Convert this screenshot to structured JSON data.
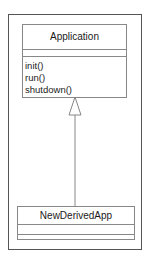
{
  "diagram": {
    "type": "uml-class-diagram",
    "classes": [
      {
        "name": "Application",
        "attributes": [],
        "operations": [
          "init()",
          "run()",
          "shutdown()"
        ]
      },
      {
        "name": "NewDerivedApp",
        "attributes": [],
        "operations": []
      }
    ],
    "relationships": [
      {
        "type": "generalization",
        "from": "NewDerivedApp",
        "to": "Application"
      }
    ],
    "colors": {
      "frame": "#555555",
      "box_border": "#888888",
      "line": "#888888",
      "text": "#1a1a1a"
    }
  }
}
